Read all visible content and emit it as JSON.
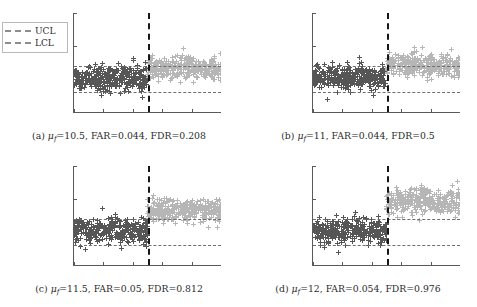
{
  "figure": {
    "legend": {
      "ucl_label": "UCL",
      "lcl_label": "LCL"
    },
    "axis": {
      "yticks": [
        "10",
        "5",
        "0",
        "-5"
      ],
      "xticks": [
        "0",
        "200",
        "400",
        "600",
        "800",
        "1000"
      ]
    },
    "subplots": [
      {
        "tag": "(a)",
        "mu_symbol": "μ",
        "mu_sub": "f",
        "mu_value": "=10.5,",
        "far": "FAR=0.044,",
        "fdr": "FDR=0.208",
        "caption_full": "(a) μf=10.5, FAR=0.044, FDR=0.208"
      },
      {
        "tag": "(b)",
        "mu_symbol": "μ",
        "mu_sub": "f",
        "mu_value": "=11,",
        "far": "FAR=0.044,",
        "fdr": "FDR=0.5",
        "caption_full": "(b) μf=11, FAR=0.044, FDR=0.5"
      },
      {
        "tag": "(c)",
        "mu_symbol": "μ",
        "mu_sub": "f",
        "mu_value": "=11.5,",
        "far": "FAR=0.05,",
        "fdr": "FDR=0.812",
        "caption_full": "(c) μf=11.5, FAR=0.05, FDR=0.812"
      },
      {
        "tag": "(d)",
        "mu_symbol": "μ",
        "mu_sub": "f",
        "mu_value": "=12,",
        "far": "FAR=0.054,",
        "fdr": "FDR=0.976",
        "caption_full": "(d) μf=12, FAR=0.054, FDR=0.976"
      }
    ]
  },
  "colors": {
    "pre_fault_marker": "#565656",
    "post_fault_marker": "#b6b6b6",
    "control_limit": "#6e6e6e",
    "fault_line": "#161616",
    "axis": "#5a5a5a"
  },
  "chart_data": {
    "type": "scatter",
    "title": "",
    "panels": [
      {
        "id": "a",
        "label": "(a)",
        "mu_f": 10.5,
        "FAR": 0.044,
        "FDR": 0.208,
        "xlabel": "",
        "ylabel": "",
        "xlim": [
          0,
          1000
        ],
        "ylim": [
          -5,
          10
        ],
        "xticks": [
          0,
          200,
          400,
          600,
          800,
          1000
        ],
        "yticks": [
          -5,
          0,
          5,
          10
        ],
        "grid": false,
        "fault_start": 500,
        "UCL": 2.0,
        "LCL": -2.0,
        "series": [
          {
            "name": "pre-fault statistic",
            "x_range": [
              0,
              500
            ],
            "mean": 0.15,
            "sd": 0.95,
            "n": 500,
            "color": "#565656",
            "marker": "+"
          },
          {
            "name": "post-fault statistic",
            "x_range": [
              500,
              1000
            ],
            "mean": 1.6,
            "sd": 0.85,
            "n": 500,
            "color": "#b6b6b6",
            "marker": "+"
          }
        ]
      },
      {
        "id": "b",
        "label": "(b)",
        "mu_f": 11,
        "FAR": 0.044,
        "FDR": 0.5,
        "xlabel": "",
        "ylabel": "",
        "xlim": [
          0,
          1000
        ],
        "ylim": [
          -5,
          10
        ],
        "xticks": [
          0,
          200,
          400,
          600,
          800,
          1000
        ],
        "yticks": [
          -5,
          0,
          5,
          10
        ],
        "grid": false,
        "fault_start": 500,
        "UCL": 2.0,
        "LCL": -2.0,
        "series": [
          {
            "name": "pre-fault statistic",
            "x_range": [
              0,
              500
            ],
            "mean": 0.2,
            "sd": 0.95,
            "n": 500,
            "color": "#565656",
            "marker": "+"
          },
          {
            "name": "post-fault statistic",
            "x_range": [
              500,
              1000
            ],
            "mean": 2.1,
            "sd": 0.85,
            "n": 500,
            "color": "#b6b6b6",
            "marker": "+"
          }
        ]
      },
      {
        "id": "c",
        "label": "(c)",
        "mu_f": 11.5,
        "FAR": 0.05,
        "FDR": 0.812,
        "xlabel": "",
        "ylabel": "",
        "xlim": [
          0,
          1000
        ],
        "ylim": [
          -5,
          10
        ],
        "xticks": [
          0,
          200,
          400,
          600,
          800,
          1000
        ],
        "yticks": [
          -5,
          0,
          5,
          10
        ],
        "grid": false,
        "fault_start": 500,
        "UCL": 2.0,
        "LCL": -2.0,
        "series": [
          {
            "name": "pre-fault statistic",
            "x_range": [
              0,
              500
            ],
            "mean": 0.2,
            "sd": 0.95,
            "n": 500,
            "color": "#565656",
            "marker": "+"
          },
          {
            "name": "post-fault statistic",
            "x_range": [
              500,
              1000
            ],
            "mean": 3.3,
            "sd": 0.9,
            "n": 500,
            "color": "#b6b6b6",
            "marker": "+"
          }
        ]
      },
      {
        "id": "d",
        "label": "(d)",
        "mu_f": 12,
        "FAR": 0.054,
        "FDR": 0.976,
        "xlabel": "",
        "ylabel": "",
        "xlim": [
          0,
          1000
        ],
        "ylim": [
          -5,
          10
        ],
        "xticks": [
          0,
          200,
          400,
          600,
          800,
          1000
        ],
        "yticks": [
          -5,
          0,
          5,
          10
        ],
        "grid": false,
        "fault_start": 500,
        "UCL": 2.0,
        "LCL": -2.0,
        "series": [
          {
            "name": "pre-fault statistic",
            "x_range": [
              0,
              500
            ],
            "mean": 0.2,
            "sd": 0.95,
            "n": 500,
            "color": "#565656",
            "marker": "+"
          },
          {
            "name": "post-fault statistic",
            "x_range": [
              500,
              1000
            ],
            "mean": 4.6,
            "sd": 0.95,
            "n": 500,
            "color": "#b6b6b6",
            "marker": "+"
          }
        ]
      }
    ]
  }
}
